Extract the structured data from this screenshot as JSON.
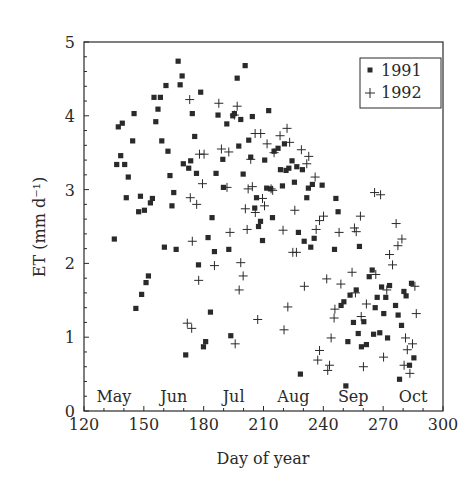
{
  "chart_data": {
    "type": "scatter",
    "title": "",
    "xlabel": "Day of year",
    "ylabel": "ET (mm d⁻¹)",
    "xlim": [
      120,
      300
    ],
    "ylim": [
      0,
      5
    ],
    "x_ticks": [
      120,
      150,
      180,
      210,
      240,
      270,
      300
    ],
    "x_tick_labels": [
      "120",
      "150",
      "180",
      "210",
      "240",
      "270",
      "300"
    ],
    "y_ticks": [
      0,
      1,
      2,
      3,
      4,
      5
    ],
    "y_tick_labels": [
      "0",
      "1",
      "2",
      "3",
      "4",
      "5"
    ],
    "grid": false,
    "legend_position": "upper right",
    "annotations": [
      {
        "text": "May",
        "x": 135
      },
      {
        "text": "Jun",
        "x": 165
      },
      {
        "text": "Jul",
        "x": 195
      },
      {
        "text": "Aug",
        "x": 225
      },
      {
        "text": "Sep",
        "x": 255
      },
      {
        "text": "Oct",
        "x": 285
      }
    ],
    "series": [
      {
        "name": "1991",
        "marker": "square",
        "points": [
          [
            135.2,
            2.33
          ],
          [
            136.4,
            3.34
          ],
          [
            137.2,
            3.85
          ],
          [
            138.4,
            3.46
          ],
          [
            139.2,
            3.9
          ],
          [
            140.4,
            3.34
          ],
          [
            141.2,
            2.89
          ],
          [
            142.2,
            3.17
          ],
          [
            144.4,
            3.66
          ],
          [
            145.1,
            4.03
          ],
          [
            146.0,
            1.39
          ],
          [
            147.4,
            2.7
          ],
          [
            148.3,
            2.91
          ],
          [
            148.9,
            1.58
          ],
          [
            150.3,
            2.72
          ],
          [
            151.1,
            1.74
          ],
          [
            152.3,
            1.83
          ],
          [
            153.3,
            2.82
          ],
          [
            154.3,
            2.88
          ],
          [
            155.1,
            4.25
          ],
          [
            156.0,
            3.92
          ],
          [
            157.1,
            4.09
          ],
          [
            158.3,
            4.25
          ],
          [
            159.0,
            3.66
          ],
          [
            160.3,
            2.22
          ],
          [
            161.1,
            4.41
          ],
          [
            162.1,
            3.52
          ],
          [
            163.1,
            3.19
          ],
          [
            164.1,
            2.78
          ],
          [
            165.0,
            2.96
          ],
          [
            166.2,
            2.19
          ],
          [
            167.2,
            4.74
          ],
          [
            168.2,
            4.42
          ],
          [
            169.2,
            4.54
          ],
          [
            169.8,
            3.35
          ],
          [
            171.0,
            0.76
          ],
          [
            172.5,
            3.29
          ],
          [
            173.5,
            3.39
          ],
          [
            174.3,
            4.03
          ],
          [
            175.5,
            3.72
          ],
          [
            176.4,
            3.22
          ],
          [
            177.4,
            1.98
          ],
          [
            178.5,
            4.32
          ],
          [
            179.9,
            0.87
          ],
          [
            181.0,
            0.94
          ],
          [
            182.2,
            2.35
          ],
          [
            183.4,
            1.34
          ],
          [
            184.2,
            2.62
          ],
          [
            185.4,
            2.16
          ],
          [
            186.2,
            3.22
          ],
          [
            187.2,
            4.01
          ],
          [
            189.6,
            3.41
          ],
          [
            189.9,
            3.03
          ],
          [
            191.6,
            3.89
          ],
          [
            192.6,
            2.19
          ],
          [
            193.6,
            1.02
          ],
          [
            194.6,
            4.0
          ],
          [
            195.4,
            4.03
          ],
          [
            196.8,
            4.51
          ],
          [
            197.6,
            3.59
          ],
          [
            198.6,
            3.95
          ],
          [
            199.8,
            3.21
          ],
          [
            200.8,
            4.68
          ],
          [
            202.6,
            3.67
          ],
          [
            203.6,
            3.44
          ],
          [
            204.4,
            3.99
          ],
          [
            205.6,
            2.75
          ],
          [
            206.5,
            2.89
          ],
          [
            207.5,
            2.5
          ],
          [
            208.5,
            2.57
          ],
          [
            209.5,
            2.31
          ],
          [
            210.6,
            3.4
          ],
          [
            211.6,
            3.02
          ],
          [
            212.6,
            4.07
          ],
          [
            213.5,
            3.01
          ],
          [
            214.5,
            2.62
          ],
          [
            215.3,
            3.52
          ],
          [
            217.3,
            3.56
          ],
          [
            218.5,
            3.27
          ],
          [
            219.5,
            3.05
          ],
          [
            220.5,
            3.62
          ],
          [
            221.3,
            3.26
          ],
          [
            222.7,
            3.29
          ],
          [
            224.3,
            3.39
          ],
          [
            225.5,
            3.1
          ],
          [
            226.7,
            3.31
          ],
          [
            227.5,
            2.42
          ],
          [
            228.5,
            0.5
          ],
          [
            229.5,
            3.27
          ],
          [
            230.4,
            2.3
          ],
          [
            231.7,
            2.89
          ],
          [
            232.5,
            3.02
          ],
          [
            233.7,
            2.22
          ],
          [
            234.5,
            3.07
          ],
          [
            235.4,
            2.34
          ],
          [
            239.4,
            3.06
          ],
          [
            245.6,
            2.19
          ],
          [
            246.3,
            2.88
          ],
          [
            247.4,
            2.7
          ],
          [
            248.9,
            1.43
          ],
          [
            250.3,
            1.48
          ],
          [
            251.3,
            0.34
          ],
          [
            252.3,
            0.94
          ],
          [
            253.4,
            1.57
          ],
          [
            255.1,
            1.2
          ],
          [
            256.5,
            1.64
          ],
          [
            257.5,
            1.05
          ],
          [
            258.1,
            2.23
          ],
          [
            259.1,
            0.87
          ],
          [
            260.3,
            1.21
          ],
          [
            261.6,
            0.9
          ],
          [
            263.0,
            1.82
          ],
          [
            264.5,
            1.91
          ],
          [
            265.2,
            1.04
          ],
          [
            266.0,
            1.4
          ],
          [
            267.0,
            1.54
          ],
          [
            268.3,
            1.06
          ],
          [
            269.2,
            1.68
          ],
          [
            270.3,
            1.32
          ],
          [
            271.3,
            1.54
          ],
          [
            272.2,
            0.99
          ],
          [
            273.2,
            1.7
          ],
          [
            276.2,
            1.43
          ],
          [
            277.5,
            1.3
          ],
          [
            278.2,
            0.43
          ],
          [
            279.2,
            1.16
          ],
          [
            280.4,
            1.62
          ],
          [
            281.5,
            1.56
          ],
          [
            283.2,
            0.62
          ],
          [
            284.2,
            1.73
          ],
          [
            285.4,
            0.72
          ]
        ]
      },
      {
        "name": "1992",
        "marker": "plus",
        "points": [
          [
            173.0,
            4.22
          ],
          [
            187.6,
            4.17
          ],
          [
            196.8,
            4.13
          ],
          [
            195.4,
            4.01
          ],
          [
            205.8,
            3.76
          ],
          [
            208.6,
            3.76
          ],
          [
            218.3,
            3.73
          ],
          [
            221.8,
            3.83
          ],
          [
            211.8,
            3.62
          ],
          [
            223.1,
            3.64
          ],
          [
            188.9,
            3.55
          ],
          [
            192.6,
            3.51
          ],
          [
            177.9,
            3.48
          ],
          [
            180.2,
            3.48
          ],
          [
            215.3,
            3.5
          ],
          [
            229.0,
            3.54
          ],
          [
            232.7,
            3.45
          ],
          [
            231.7,
            3.35
          ],
          [
            235.9,
            3.17
          ],
          [
            203.6,
            3.41
          ],
          [
            179.4,
            3.08
          ],
          [
            191.7,
            3.03
          ],
          [
            202.3,
            3.01
          ],
          [
            204.4,
            3.04
          ],
          [
            213.8,
            3.01
          ],
          [
            214.6,
            2.99
          ],
          [
            173.3,
            2.89
          ],
          [
            176.5,
            2.8
          ],
          [
            209.5,
            2.88
          ],
          [
            210.5,
            2.78
          ],
          [
            200.9,
            2.74
          ],
          [
            205.9,
            2.69
          ],
          [
            225.7,
            2.72
          ],
          [
            240.1,
            2.64
          ],
          [
            238.1,
            2.58
          ],
          [
            236.4,
            2.46
          ],
          [
            258.6,
            2.64
          ],
          [
            265.7,
            2.96
          ],
          [
            268.7,
            2.93
          ],
          [
            276.5,
            2.54
          ],
          [
            279.4,
            2.33
          ],
          [
            277.4,
            2.24
          ],
          [
            273.2,
            2.12
          ],
          [
            274.7,
            1.98
          ],
          [
            247.9,
            2.42
          ],
          [
            255.6,
            2.48
          ],
          [
            256.5,
            2.43
          ],
          [
            201.8,
            2.46
          ],
          [
            219.8,
            2.45
          ],
          [
            193.2,
            2.42
          ],
          [
            174.3,
            2.3
          ],
          [
            224.7,
            2.15
          ],
          [
            226.5,
            2.15
          ],
          [
            185.4,
            1.97
          ],
          [
            198.6,
            2.01
          ],
          [
            199.8,
            1.83
          ],
          [
            177.5,
            1.77
          ],
          [
            197.8,
            1.64
          ],
          [
            241.7,
            1.79
          ],
          [
            254.4,
            1.88
          ],
          [
            248.8,
            1.72
          ],
          [
            230.5,
            1.69
          ],
          [
            256.1,
            1.6
          ],
          [
            266.3,
            1.85
          ],
          [
            271.8,
            1.64
          ],
          [
            285.9,
            1.69
          ],
          [
            245.8,
            1.38
          ],
          [
            245.4,
            1.26
          ],
          [
            261.6,
            1.45
          ],
          [
            259.0,
            1.28
          ],
          [
            222.2,
            1.41
          ],
          [
            286.6,
            1.32
          ],
          [
            171.8,
            1.19
          ],
          [
            174.0,
            1.12
          ],
          [
            207.1,
            1.24
          ],
          [
            220.3,
            1.1
          ],
          [
            243.9,
            0.99
          ],
          [
            281.2,
            0.99
          ],
          [
            284.7,
            0.91
          ],
          [
            195.8,
            0.91
          ],
          [
            282.1,
            0.83
          ],
          [
            238.1,
            0.82
          ],
          [
            237.2,
            0.69
          ],
          [
            270.2,
            0.73
          ],
          [
            260.1,
            0.6
          ],
          [
            243.1,
            0.62
          ],
          [
            242.2,
            0.55
          ],
          [
            280.5,
            0.62
          ],
          [
            283.4,
            0.51
          ]
        ]
      }
    ]
  },
  "legend": {
    "items": [
      {
        "label": "1991",
        "marker": "square"
      },
      {
        "label": "1992",
        "marker": "plus"
      }
    ]
  },
  "axes": {
    "xlabel": "Day of year",
    "ylabel": "ET (mm d⁻¹)"
  },
  "colors": {
    "ink": "#2a2a2a",
    "background": "#ffffff"
  }
}
